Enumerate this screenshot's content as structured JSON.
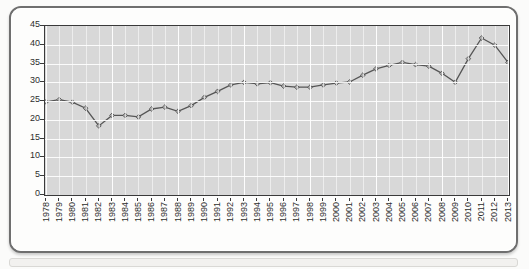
{
  "chart_data": {
    "type": "line",
    "title": "",
    "subtitle": "",
    "xlabel": "",
    "ylabel": "",
    "xlim": [
      1978,
      2013
    ],
    "ylim": [
      0,
      45
    ],
    "ytick_step": 5,
    "grid": true,
    "legend": null,
    "marker": "diamond",
    "line_color": "#555555",
    "marker_color": "#b0b0b0",
    "marker_edge_color": "#4a4a4a",
    "plot_bg": "#d8d8d8",
    "gridline_color": "#ffffff",
    "categories": [
      "1978",
      "1979",
      "1980",
      "1981",
      "1982",
      "1983",
      "1984",
      "1985",
      "1986",
      "1987",
      "1988",
      "1989",
      "1990",
      "1991",
      "1992",
      "1993",
      "1994",
      "1995",
      "1996",
      "1997",
      "1998",
      "1999",
      "2000",
      "2001",
      "2002",
      "2003",
      "2004",
      "2005",
      "2006",
      "2007",
      "2008",
      "2009",
      "2010",
      "2011",
      "2012",
      "2013"
    ],
    "yticks": [
      0,
      5,
      10,
      15,
      20,
      25,
      30,
      35,
      40,
      45
    ],
    "ytick_labels": [
      "0",
      "5",
      "10",
      "15",
      "20",
      "25",
      "30",
      "35",
      "40",
      "45"
    ],
    "values": [
      24.8,
      25.4,
      24.7,
      23.1,
      18.4,
      21.2,
      21.2,
      20.8,
      22.9,
      23.4,
      22.3,
      23.8,
      26.0,
      27.6,
      29.3,
      30.0,
      29.6,
      29.9,
      29.0,
      28.7,
      28.7,
      29.3,
      29.8,
      30.1,
      31.9,
      33.6,
      34.5,
      35.3,
      34.7,
      34.3,
      32.4,
      30.0,
      36.3,
      41.8,
      39.9,
      35.3
    ],
    "series_name": ""
  }
}
